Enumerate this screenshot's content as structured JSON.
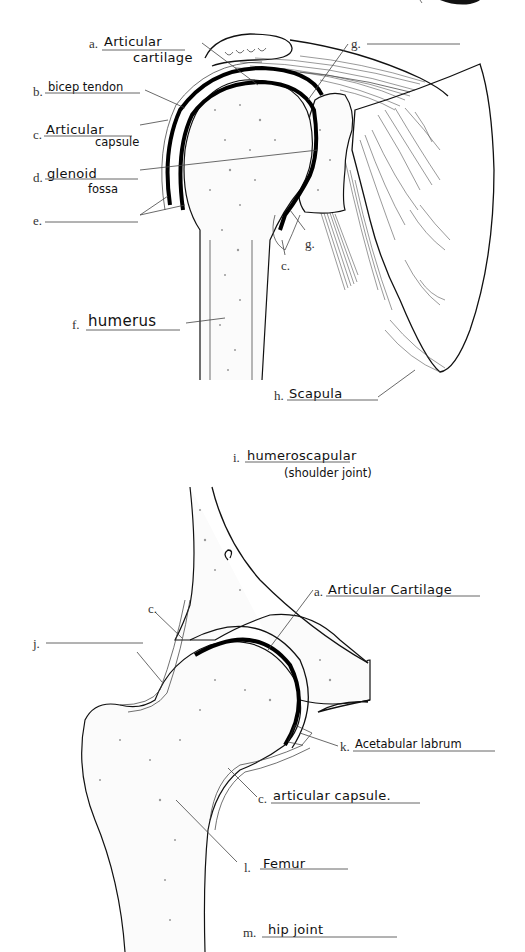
{
  "worksheet": {
    "shoulder": {
      "labels": [
        {
          "key": "a",
          "letter": "a.",
          "answer": "Articular",
          "answer_line2": "cartilage"
        },
        {
          "key": "b",
          "letter": "b.",
          "answer": "bicep tendon"
        },
        {
          "key": "c",
          "letter": "c.",
          "answer": "Articular",
          "answer_line2": "capsule"
        },
        {
          "key": "d",
          "letter": "d.",
          "answer": "glenoid",
          "answer_line2": "fossa"
        },
        {
          "key": "e",
          "letter": "e.",
          "answer": ""
        },
        {
          "key": "f",
          "letter": "f.",
          "answer": "humerus"
        },
        {
          "key": "g_top",
          "letter": "g.",
          "answer": ""
        },
        {
          "key": "g_inner",
          "letter": "g.",
          "answer": ""
        },
        {
          "key": "c_inner",
          "letter": "c.",
          "answer": ""
        },
        {
          "key": "h",
          "letter": "h.",
          "answer": "Scapula"
        }
      ],
      "title": {
        "letter": "i.",
        "answer": "humeroscapular",
        "answer_line2": "(shoulder joint)"
      }
    },
    "hip": {
      "labels": [
        {
          "key": "c_top",
          "letter": "c.",
          "answer": ""
        },
        {
          "key": "j",
          "letter": "j.",
          "answer": ""
        },
        {
          "key": "a",
          "letter": "a.",
          "answer": "Articular Cartilage"
        },
        {
          "key": "k",
          "letter": "k.",
          "answer": "Acetabular labrum"
        },
        {
          "key": "c",
          "letter": "c.",
          "answer": "articular capsule."
        },
        {
          "key": "l",
          "letter": "l.",
          "answer": "Femur"
        },
        {
          "key": "m",
          "letter": "m.",
          "answer": "hip joint"
        },
        {
          "key": "e_mark",
          "letter": "e.",
          "answer": ""
        }
      ]
    }
  }
}
